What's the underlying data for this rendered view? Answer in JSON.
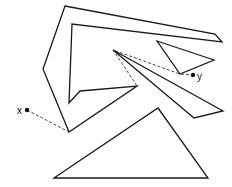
{
  "diagram": {
    "type": "shortest-path-among-polygonal-obstacles",
    "stroke_color": "#1a1a1a",
    "background": "#ffffff",
    "obstacles": [
      {
        "id": "c-shape",
        "points": "65,6 215,34 222,42 72,24 69,103 80,91 137,86 69,132 43,69"
      },
      {
        "id": "small-triangle",
        "points": "157,41 214,60 180,74"
      },
      {
        "id": "sliver",
        "points": "113,50 223,111 194,118"
      },
      {
        "id": "large-triangle",
        "points": "54,178 158,108 208,178"
      }
    ],
    "path": {
      "points": "27,110 69,132 137,86 113,50 180,74 193,75",
      "style": "dashed"
    },
    "points": {
      "x": {
        "label": "x",
        "cx": 27,
        "cy": 110,
        "lx": 17,
        "ly": 114
      },
      "y": {
        "label": "y",
        "cx": 193,
        "cy": 75,
        "lx": 197,
        "ly": 80
      }
    }
  }
}
